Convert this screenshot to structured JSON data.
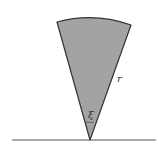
{
  "diagram": {
    "labels": {
      "radius": "r",
      "angle": "ξ"
    },
    "colors": {
      "sector_fill": "#a3a3a3",
      "stroke": "#333333",
      "baseline": "#555555"
    }
  }
}
